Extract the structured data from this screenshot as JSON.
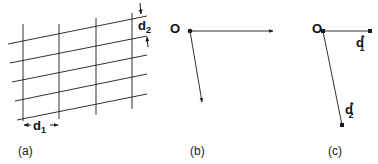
{
  "panels": {
    "a": {
      "caption": "(a)",
      "d1_label": "d",
      "d1_sub": "1",
      "d2_label": "d",
      "d2_sub": "2"
    },
    "b": {
      "caption": "(b)",
      "origin_label": "O"
    },
    "c": {
      "caption": "(c)",
      "origin_label": "O",
      "d1_label": "d",
      "d1_sub": "1",
      "d1_sup": "*",
      "d2_label": "d",
      "d2_sub": "2",
      "d2_sup": "*"
    }
  },
  "colors": {
    "line": "#1a1a1a",
    "background": "#ffffff"
  }
}
